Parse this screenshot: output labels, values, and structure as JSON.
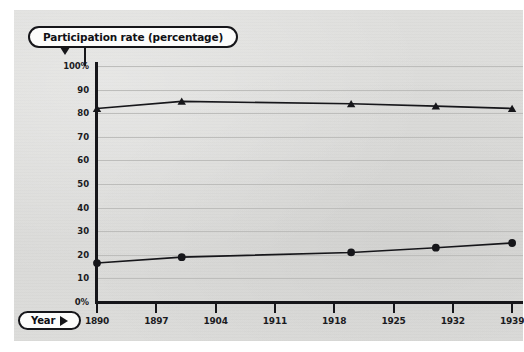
{
  "axis_labels": {
    "y_title": "Participation rate (percentage)",
    "x_title": "Year",
    "y_arrow_icon": "triangle-down-icon",
    "x_arrow_icon": "triangle-right-icon"
  },
  "chart_data": {
    "type": "line",
    "title": "Participation rate (percentage)",
    "xlabel": "Year",
    "ylabel": "Participation rate (percentage)",
    "xlim": [
      1890,
      1939
    ],
    "ylim": [
      0,
      100
    ],
    "grid": true,
    "legend": "none",
    "x_ticks": [
      "1890",
      "1897",
      "1904",
      "1911",
      "1918",
      "1925",
      "1932",
      "1939"
    ],
    "x_tick_values": [
      1890,
      1897,
      1904,
      1911,
      1918,
      1925,
      1932,
      1939
    ],
    "y_ticks": [
      "0%",
      "10",
      "20",
      "30",
      "40",
      "50",
      "60",
      "70",
      "80",
      "90",
      "100%"
    ],
    "y_tick_values": [
      0,
      10,
      20,
      30,
      40,
      50,
      60,
      70,
      80,
      90,
      100
    ],
    "series": [
      {
        "name": "upper-series",
        "marker": "triangle",
        "x": [
          1890,
          1900,
          1920,
          1930,
          1939
        ],
        "values": [
          82,
          85,
          84,
          83,
          82
        ]
      },
      {
        "name": "lower-series",
        "marker": "circle",
        "x": [
          1890,
          1900,
          1920,
          1930,
          1939
        ],
        "values": [
          16.5,
          19,
          21,
          23,
          25
        ]
      }
    ]
  },
  "colors": {
    "ink": "#16161a",
    "paper": "#dcdcda",
    "gridline": "#bdbdbb",
    "pill_fill": "#fcfcfb"
  }
}
